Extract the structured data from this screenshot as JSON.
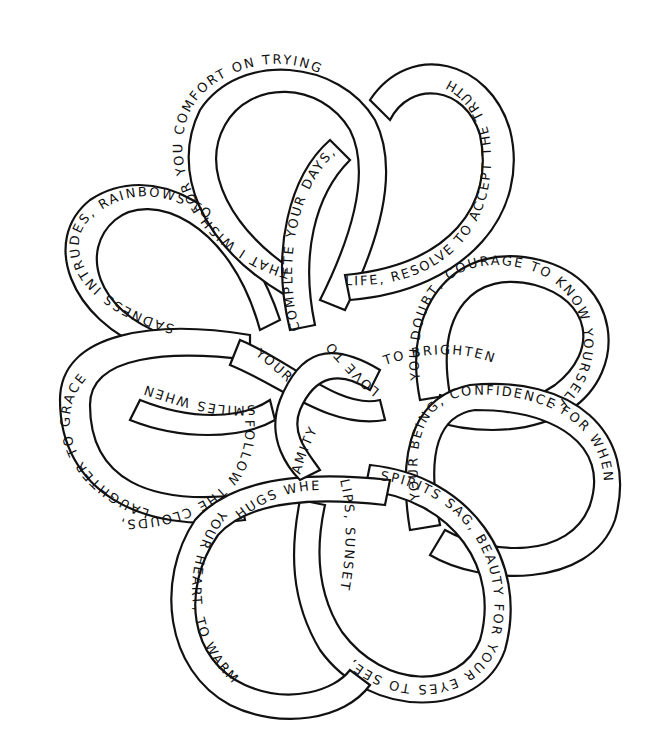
{
  "image": {
    "description": "Celtic knot coloring page of six interlaced ribbon loops forming a flower, with text written along the ribbons",
    "background": "#ffffff",
    "ink": "#111111"
  },
  "ribbons": [
    {
      "id": "top-left-loop",
      "text": "THAT I WISH FOR YOU COMFORT ON TRYING"
    },
    {
      "id": "top-right-loop",
      "text": "LIFE, RESOLVE TO ACCEPT THE TRUTH"
    },
    {
      "id": "center-vertical",
      "text": "COMPLETE YOUR DAYS,"
    },
    {
      "id": "left-upper-loop",
      "text": "SADNESS INTRUDES, RAINBOWS TO"
    },
    {
      "id": "left-lower-loop",
      "text": "LAUGHTER TO GRACE"
    },
    {
      "id": "left-cross",
      "text": "SMILES WHEN"
    },
    {
      "id": "left-tail",
      "text": "FOLLOW THE CLOUDS,"
    },
    {
      "id": "center-your",
      "text": "YOUR"
    },
    {
      "id": "center-love",
      "text": "LOVE TO"
    },
    {
      "id": "center-amity",
      "text": "AMITY"
    },
    {
      "id": "right-upper-loop",
      "text": "YOU DOUBT, COURAGE TO KNOW YOURSELF,"
    },
    {
      "id": "right-cross",
      "text": "TO BRIGHTEN"
    },
    {
      "id": "right-lower-loop",
      "text": "YOUR BEING, CONFIDENCE FOR WHEN"
    },
    {
      "id": "bottom-right-loop",
      "text": "SPIRITS SAG, BEAUTY FOR YOUR EYES TO SEE,"
    },
    {
      "id": "bottom-center",
      "text": "LIPS, SUNSETS"
    },
    {
      "id": "bottom-left-loop",
      "text": "HUGS WHEN"
    },
    {
      "id": "bottom-left-tail",
      "text": "YOUR HEART, TO WARM"
    }
  ]
}
